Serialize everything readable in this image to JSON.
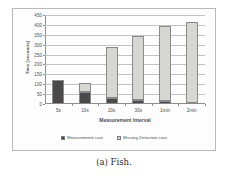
{
  "caption": "(a) Fish.",
  "chart_data": {
    "type": "bar",
    "subtype": "stacked",
    "title": "",
    "xlabel": "Measurement Interval",
    "ylabel": "Time [seconds]",
    "categories": [
      "5s",
      "10s",
      "20s",
      "30s",
      "1min",
      "2min"
    ],
    "series": [
      {
        "name": "Measurement cost",
        "color": "#4a4a4a",
        "values": [
          120,
          62,
          30,
          18,
          14,
          6
        ]
      },
      {
        "name": "Missing Detection cost",
        "color": "#d6d6d2",
        "values": [
          0,
          43,
          260,
          325,
          379,
          409
        ]
      }
    ],
    "totals": [
      120,
      105,
      290,
      343,
      393,
      415
    ],
    "ylim": [
      0,
      450
    ],
    "ytick_labels": [
      "0",
      "50",
      "100",
      "150",
      "200",
      "250",
      "300",
      "350",
      "400",
      "450"
    ],
    "ytick_values": [
      0,
      50,
      100,
      150,
      200,
      250,
      300,
      350,
      400,
      450
    ],
    "grid": true,
    "legend_position": "bottom"
  }
}
